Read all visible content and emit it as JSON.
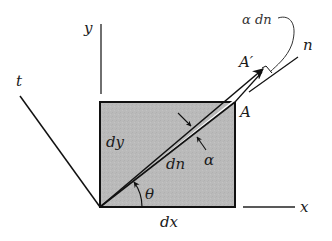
{
  "figure": {
    "colors": {
      "line": "#111111",
      "element_fill": "#b9b9b9",
      "wedge_fill": "#ffffff",
      "label": "#1a1a1a"
    },
    "labels": {
      "y_axis": "y",
      "x_axis": "x",
      "t_axis": "t",
      "n_axis": "n",
      "point_A": "A",
      "point_A_prime": "A′",
      "side_dx": "dx",
      "side_dy": "dy",
      "diagonal_dn": "dn",
      "angle_theta": "θ",
      "angle_alpha": "α",
      "arc_alpha_dn": "α dn"
    }
  }
}
